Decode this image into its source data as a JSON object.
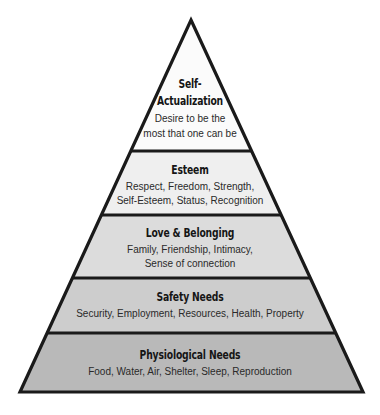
{
  "diagram": {
    "type": "pyramid",
    "stroke_color": "#1a1a1a",
    "tiers": [
      {
        "id": "self-actualization",
        "title_lines": [
          "Self-",
          "Actualization"
        ],
        "desc_lines": [
          "Desire to be the",
          "most that one can be"
        ],
        "fill": "#fbfbfb"
      },
      {
        "id": "esteem",
        "title_lines": [
          "Esteem"
        ],
        "desc_lines": [
          "Respect, Freedom, Strength,",
          "Self-Esteem, Status, Recognition"
        ],
        "fill": "#efefef"
      },
      {
        "id": "love-belonging",
        "title_lines": [
          "Love & Belonging"
        ],
        "desc_lines": [
          "Family, Friendship, Intimacy,",
          "Sense of connection"
        ],
        "fill": "#dcdcdc"
      },
      {
        "id": "safety-needs",
        "title_lines": [
          "Safety Needs"
        ],
        "desc_lines": [
          "Security, Employment, Resources, Health, Property"
        ],
        "fill": "#cdcdcd"
      },
      {
        "id": "physiological-needs",
        "title_lines": [
          "Physiological Needs"
        ],
        "desc_lines": [
          "Food, Water, Air, Shelter, Sleep, Reproduction"
        ],
        "fill": "#b9b9b9"
      }
    ]
  }
}
